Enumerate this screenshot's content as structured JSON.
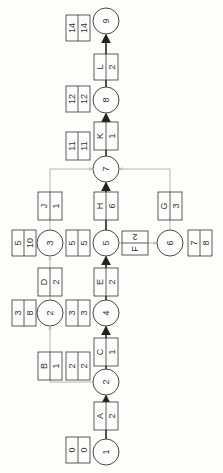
{
  "diagram": {
    "type": "activity-on-arrow network (rotated 90°)",
    "nodes": [
      {
        "id": "1",
        "label": "1",
        "es": "0",
        "lf": "0",
        "cx": 106,
        "cy": 452
      },
      {
        "id": "2b",
        "label": "2",
        "es": "2",
        "lf": "2",
        "cx": 106,
        "cy": 382
      },
      {
        "id": "2a",
        "label": "2",
        "es": "3",
        "lf": "8",
        "cx": 50,
        "cy": 313
      },
      {
        "id": "4",
        "label": "4",
        "es": "3",
        "lf": "3",
        "cx": 106,
        "cy": 313
      },
      {
        "id": "3",
        "label": "3",
        "es": "5",
        "lf": "10",
        "cx": 50,
        "cy": 243
      },
      {
        "id": "5",
        "label": "5",
        "es": "5",
        "lf": "5",
        "cx": 106,
        "cy": 243
      },
      {
        "id": "6",
        "label": "6",
        "es": "7",
        "lf": "8",
        "cx": 170,
        "cy": 243
      },
      {
        "id": "7",
        "label": "7",
        "es": "11",
        "lf": "11",
        "cx": 106,
        "cy": 169
      },
      {
        "id": "8",
        "label": "8",
        "es": "12",
        "lf": "12",
        "cx": 106,
        "cy": 100
      },
      {
        "id": "9",
        "label": "9",
        "es": "14",
        "lf": "14",
        "cx": 106,
        "cy": 21
      }
    ],
    "activities": [
      {
        "name": "A",
        "duration": "2",
        "from": "1",
        "to": "2b",
        "critical": true
      },
      {
        "name": "B",
        "duration": "1",
        "from": "2b",
        "to": "2a",
        "critical": false
      },
      {
        "name": "C",
        "duration": "1",
        "from": "2b",
        "to": "4",
        "critical": true
      },
      {
        "name": "D",
        "duration": "2",
        "from": "2a",
        "to": "3",
        "critical": false
      },
      {
        "name": "E",
        "duration": "2",
        "from": "4",
        "to": "5",
        "critical": true
      },
      {
        "name": "F",
        "duration": "2",
        "from": "5",
        "to": "6",
        "critical": false
      },
      {
        "name": "G",
        "duration": "3",
        "from": "6",
        "to": "7",
        "critical": false
      },
      {
        "name": "H",
        "duration": "6",
        "from": "5",
        "to": "7",
        "critical": true
      },
      {
        "name": "J",
        "duration": "1",
        "from": "3",
        "to": "7",
        "critical": false
      },
      {
        "name": "K",
        "duration": "1",
        "from": "7",
        "to": "8",
        "critical": true
      },
      {
        "name": "L",
        "duration": "2",
        "from": "8",
        "to": "9",
        "critical": true
      }
    ]
  },
  "labels": {
    "n1": "1",
    "n2b": "2",
    "n2a": "2",
    "n4": "4",
    "n3": "3",
    "n5": "5",
    "n6": "6",
    "n7": "7",
    "n8": "8",
    "n9": "9",
    "t1a": "0",
    "t1b": "0",
    "t2ba": "2",
    "t2bb": "2",
    "t2aa": "3",
    "t2ab": "8",
    "t4a": "3",
    "t4b": "3",
    "t3a": "5",
    "t3b": "10",
    "t5a": "5",
    "t5b": "5",
    "t6a": "7",
    "t6b": "8",
    "t7a": "11",
    "t7b": "11",
    "t8a": "12",
    "t8b": "12",
    "t9a": "14",
    "t9b": "14",
    "A": "A",
    "Ad": "2",
    "B": "B",
    "Bd": "1",
    "C": "C",
    "Cd": "1",
    "D": "D",
    "Dd": "2",
    "E": "E",
    "Ed": "2",
    "F": "F",
    "Fd": "2",
    "G": "G",
    "Gd": "3",
    "H": "H",
    "Hd": "6",
    "J": "J",
    "Jd": "1",
    "K": "K",
    "Kd": "1",
    "L": "L",
    "Ld": "2"
  }
}
